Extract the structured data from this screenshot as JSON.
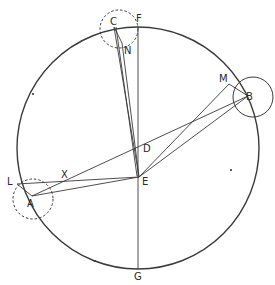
{
  "diagram": {
    "stroke_color": "#3a3a3a",
    "main_circle": {
      "cx": 138,
      "cy": 148,
      "r": 121
    },
    "small_circles": [
      {
        "name": "circle-c",
        "cx": 119,
        "cy": 29,
        "r": 19,
        "dashed": true
      },
      {
        "name": "circle-b",
        "cx": 253,
        "cy": 97,
        "r": 20,
        "dashed": false
      },
      {
        "name": "circle-a",
        "cx": 33,
        "cy": 199,
        "r": 20,
        "dashed": true
      }
    ],
    "points": {
      "A": {
        "x": 32,
        "y": 196
      },
      "B": {
        "x": 248,
        "y": 96
      },
      "C": {
        "x": 114,
        "y": 27
      },
      "D": {
        "x": 139,
        "y": 146
      },
      "E": {
        "x": 139,
        "y": 177
      },
      "F": {
        "x": 138,
        "y": 27
      },
      "G": {
        "x": 138,
        "y": 269
      },
      "L": {
        "x": 17,
        "y": 184
      },
      "M": {
        "x": 229,
        "y": 84
      },
      "N": {
        "x": 122,
        "y": 43
      },
      "X": {
        "x": 70,
        "y": 181
      }
    },
    "labels": [
      {
        "text": "F",
        "x": 136,
        "y": 14
      },
      {
        "text": "C",
        "x": 110,
        "y": 17
      },
      {
        "text": "N",
        "x": 124,
        "y": 46
      },
      {
        "text": "M",
        "x": 219,
        "y": 74
      },
      {
        "text": "B",
        "x": 246,
        "y": 92
      },
      {
        "text": "D",
        "x": 143,
        "y": 144
      },
      {
        "text": "E",
        "x": 142,
        "y": 177
      },
      {
        "text": "X",
        "x": 61,
        "y": 170
      },
      {
        "text": "L",
        "x": 7,
        "y": 177
      },
      {
        "text": "A",
        "x": 27,
        "y": 199
      },
      {
        "text": "G",
        "x": 134,
        "y": 272
      }
    ],
    "segments": [
      [
        "F",
        "G"
      ],
      [
        "C",
        "E"
      ],
      [
        "C",
        "N"
      ],
      [
        "N",
        "E"
      ],
      [
        "A",
        "B"
      ],
      [
        "A",
        "E"
      ],
      [
        "L",
        "A"
      ],
      [
        "L",
        "E"
      ],
      [
        "E",
        "B"
      ],
      [
        "E",
        "M"
      ],
      [
        "M",
        "B"
      ]
    ],
    "extra_lines": [
      {
        "x1": 116,
        "y1": 27,
        "x2": 137,
        "y2": 176
      }
    ]
  }
}
